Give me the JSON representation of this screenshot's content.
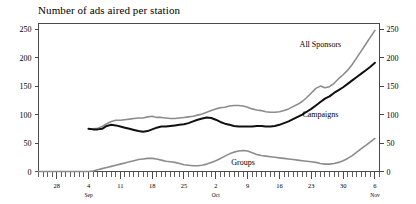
{
  "chart_data": {
    "type": "line",
    "title": "Number of ads aired per station",
    "xlabel": "",
    "ylabel": "",
    "ylim": [
      0,
      260
    ],
    "yticks": [
      0,
      50,
      100,
      150,
      200,
      250
    ],
    "grid": false,
    "legend_position": "inline-annotations",
    "dual_y_axis": true,
    "x_axis": {
      "tick_interval_days": 1,
      "labeled_ticks": [
        {
          "day_index": -7,
          "label": "28",
          "month": ""
        },
        {
          "day_index": 0,
          "label": "4",
          "month": "Sep"
        },
        {
          "day_index": 7,
          "label": "11",
          "month": ""
        },
        {
          "day_index": 14,
          "label": "18",
          "month": ""
        },
        {
          "day_index": 21,
          "label": "25",
          "month": ""
        },
        {
          "day_index": 28,
          "label": "2",
          "month": "Oct"
        },
        {
          "day_index": 35,
          "label": "9",
          "month": ""
        },
        {
          "day_index": 42,
          "label": "16",
          "month": ""
        },
        {
          "day_index": 49,
          "label": "23",
          "month": ""
        },
        {
          "day_index": 56,
          "label": "30",
          "month": ""
        },
        {
          "day_index": 63,
          "label": "6",
          "month": "Nov"
        }
      ],
      "range_day_index": [
        -11,
        64
      ]
    },
    "series": [
      {
        "name": "All Sponsors",
        "color": "#8c8c8c",
        "width": 1.6,
        "label_x_day": 51,
        "label_y_value": 218,
        "x": [
          0,
          1,
          2,
          3,
          4,
          5,
          6,
          7,
          8,
          9,
          10,
          11,
          12,
          13,
          14,
          15,
          16,
          17,
          18,
          19,
          20,
          21,
          22,
          23,
          24,
          25,
          26,
          27,
          28,
          29,
          30,
          31,
          32,
          33,
          34,
          35,
          36,
          37,
          38,
          39,
          40,
          41,
          42,
          43,
          44,
          45,
          46,
          47,
          48,
          49,
          50,
          51,
          52,
          53,
          54,
          55,
          56,
          57,
          58,
          59,
          60,
          61,
          62,
          63
        ],
        "values": [
          75,
          75,
          76,
          79,
          84,
          88,
          90,
          90,
          91,
          92,
          93,
          94,
          94,
          96,
          97,
          95,
          95,
          94,
          93,
          93,
          94,
          95,
          96,
          97,
          99,
          101,
          104,
          107,
          110,
          112,
          113,
          115,
          116,
          116,
          115,
          113,
          110,
          108,
          107,
          105,
          104,
          104,
          105,
          107,
          110,
          114,
          118,
          123,
          130,
          138,
          146,
          150,
          147,
          149,
          155,
          163,
          170,
          178,
          188,
          200,
          212,
          224,
          236,
          248
        ]
      },
      {
        "name": "Campaigns",
        "color": "#101010",
        "width": 2.0,
        "label_x_day": 51,
        "label_y_value": 96,
        "x": [
          0,
          1,
          2,
          3,
          4,
          5,
          6,
          7,
          8,
          9,
          10,
          11,
          12,
          13,
          14,
          15,
          16,
          17,
          18,
          19,
          20,
          21,
          22,
          23,
          24,
          25,
          26,
          27,
          28,
          29,
          30,
          31,
          32,
          33,
          34,
          35,
          36,
          37,
          38,
          39,
          40,
          41,
          42,
          43,
          44,
          45,
          46,
          47,
          48,
          49,
          50,
          51,
          52,
          53,
          54,
          55,
          56,
          57,
          58,
          59,
          60,
          61,
          62,
          63
        ],
        "values": [
          75,
          74,
          74,
          75,
          80,
          82,
          81,
          79,
          77,
          75,
          73,
          71,
          70,
          71,
          74,
          77,
          79,
          79,
          80,
          81,
          82,
          83,
          85,
          88,
          91,
          93,
          95,
          94,
          91,
          87,
          84,
          82,
          80,
          79,
          79,
          79,
          79,
          80,
          80,
          79,
          79,
          80,
          82,
          85,
          88,
          92,
          96,
          100,
          105,
          110,
          116,
          122,
          128,
          132,
          138,
          143,
          148,
          154,
          160,
          166,
          172,
          178,
          184,
          191
        ]
      },
      {
        "name": "Groups",
        "color": "#8c8c8c",
        "width": 1.6,
        "label_x_day": 34,
        "label_y_value": 12,
        "x": [
          -11,
          -10,
          -9,
          -8,
          -7,
          -6,
          -5,
          -4,
          -3,
          -2,
          -1,
          0,
          1,
          2,
          3,
          4,
          5,
          6,
          7,
          8,
          9,
          10,
          11,
          12,
          13,
          14,
          15,
          16,
          17,
          18,
          19,
          20,
          21,
          22,
          23,
          24,
          25,
          26,
          27,
          28,
          29,
          30,
          31,
          32,
          33,
          34,
          35,
          36,
          37,
          38,
          39,
          40,
          41,
          42,
          43,
          44,
          45,
          46,
          47,
          48,
          49,
          50,
          51,
          52,
          53,
          54,
          55,
          56,
          57,
          58,
          59,
          60,
          61,
          62,
          63
        ],
        "values": [
          0,
          0,
          0,
          0,
          0,
          0,
          0,
          0,
          0,
          0,
          0,
          0,
          1,
          3,
          5,
          7,
          9,
          11,
          13,
          15,
          17,
          19,
          21,
          22,
          23,
          23,
          22,
          20,
          18,
          17,
          16,
          14,
          12,
          11,
          10,
          10,
          11,
          13,
          16,
          19,
          23,
          27,
          31,
          34,
          36,
          37,
          36,
          33,
          30,
          28,
          27,
          26,
          25,
          24,
          23,
          22,
          21,
          20,
          19,
          18,
          17,
          16,
          14,
          13,
          13,
          14,
          16,
          19,
          23,
          28,
          34,
          40,
          46,
          52,
          58
        ]
      }
    ]
  }
}
